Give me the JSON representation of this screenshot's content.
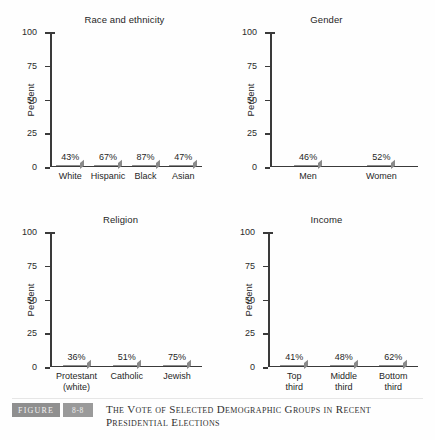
{
  "figure": {
    "badge_label": "FIGURE",
    "number": "8-8",
    "caption_line1": "The Vote of Selected Demographic Groups in Recent",
    "caption_line2": "Presidential Elections"
  },
  "axis": {
    "ylabel": "Percent",
    "ticks": [
      "100",
      "75",
      "50",
      "25",
      "0"
    ]
  },
  "chart_data": [
    {
      "type": "bar",
      "title": "Race and ethnicity",
      "xlabel": "",
      "ylabel": "Percent",
      "ylim": [
        0,
        100
      ],
      "yticks": [
        0,
        25,
        50,
        75,
        100
      ],
      "grid": false,
      "legend": "none",
      "categories": [
        "White",
        "Hispanic",
        "Black",
        "Asian"
      ],
      "values": [
        43,
        67,
        87,
        47
      ],
      "data_labels": [
        "43%",
        "67%",
        "87%",
        "47%"
      ]
    },
    {
      "type": "bar",
      "title": "Gender",
      "xlabel": "",
      "ylabel": "Percent",
      "ylim": [
        0,
        100
      ],
      "yticks": [
        0,
        25,
        50,
        75,
        100
      ],
      "grid": false,
      "legend": "none",
      "categories": [
        "Men",
        "Women"
      ],
      "values": [
        46,
        52
      ],
      "data_labels": [
        "46%",
        "52%"
      ]
    },
    {
      "type": "bar",
      "title": "Religion",
      "xlabel": "",
      "ylabel": "Percent",
      "ylim": [
        0,
        100
      ],
      "yticks": [
        0,
        25,
        50,
        75,
        100
      ],
      "grid": false,
      "legend": "none",
      "categories": [
        "Protestant (white)",
        "Catholic",
        "Jewish"
      ],
      "category_lines": [
        [
          "Protestant",
          "(white)"
        ],
        [
          "Catholic"
        ],
        [
          "Jewish"
        ]
      ],
      "values": [
        36,
        51,
        75
      ],
      "data_labels": [
        "36%",
        "51%",
        "75%"
      ]
    },
    {
      "type": "bar",
      "title": "Income",
      "xlabel": "",
      "ylabel": "Percent",
      "ylim": [
        0,
        100
      ],
      "yticks": [
        0,
        25,
        50,
        75,
        100
      ],
      "grid": false,
      "legend": "none",
      "categories": [
        "Top third",
        "Middle third",
        "Bottom third"
      ],
      "category_lines": [
        [
          "Top",
          "third"
        ],
        [
          "Middle",
          "third"
        ],
        [
          "Bottom",
          "third"
        ]
      ],
      "values": [
        41,
        48,
        62
      ],
      "data_labels": [
        "41%",
        "48%",
        "62%"
      ]
    }
  ],
  "colors": {
    "bar_light": "#e2e2e2",
    "bar_dark": "#a2a2a2",
    "bar_side": "#7d7d7d",
    "axis": "#3a3a3a",
    "badge": "#8f8f8f"
  }
}
